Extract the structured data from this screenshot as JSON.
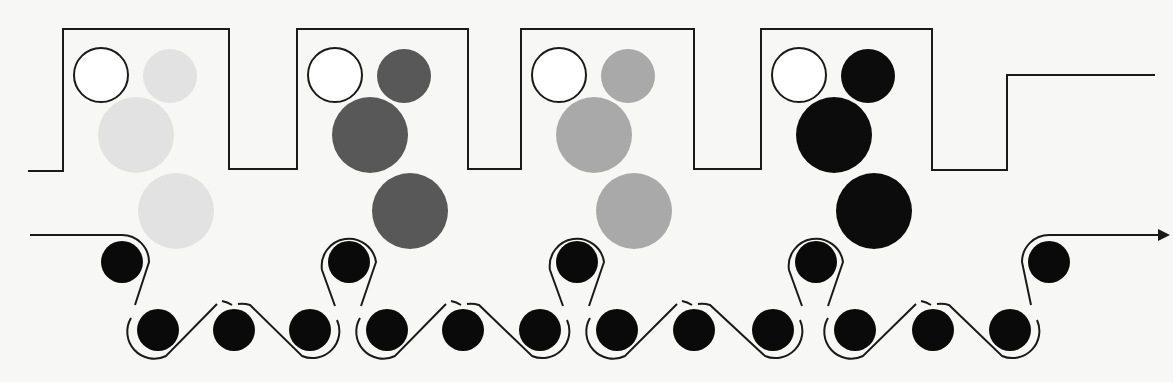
{
  "diagram": {
    "colors": {
      "background": "#f7f7f5",
      "line": "#1a1a1a",
      "roller": "#0a0a0a",
      "outline_circle_fill": "#ffffff"
    },
    "tanks": [
      {
        "id": "tank-1",
        "shade_name": "very-light-gray",
        "shade": "#e2e2e2"
      },
      {
        "id": "tank-2",
        "shade_name": "dark-gray",
        "shade": "#585858"
      },
      {
        "id": "tank-3",
        "shade_name": "medium-gray",
        "shade": "#a9a9a9"
      },
      {
        "id": "tank-4",
        "shade_name": "black",
        "shade": "#0c0c0c"
      }
    ],
    "upper_roller_count": 5,
    "lower_roller_count": 12,
    "web_direction": "left-to-right",
    "arrow": "exit-arrow"
  }
}
